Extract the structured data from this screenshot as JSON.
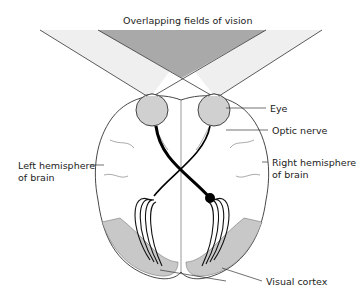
{
  "title": "Overlapping fields of vision",
  "labels": {
    "eye": "Eye",
    "optic_nerve": "Optic nerve",
    "left_hemisphere_line1": "Left hemisphere",
    "left_hemisphere_line2": "of brain",
    "right_hemisphere_line1": "Right hemisphere",
    "right_hemisphere_line2": "of brain",
    "visual_cortex": "Visual cortex"
  },
  "colors": {
    "overlap_field": "#a8a8a8",
    "side_field": "#ececec",
    "eye_fill": "#d0d0d0",
    "cortex_fill": "#c8c8c8",
    "line": "#222222"
  }
}
